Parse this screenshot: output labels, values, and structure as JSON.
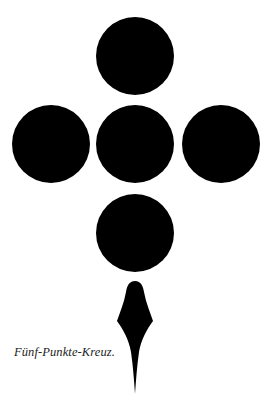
{
  "figure": {
    "caption": "Fünf-Punkte-Kreuz.",
    "fill_color": "#000000",
    "background_color": "#ffffff",
    "dots": [
      {
        "name": "top",
        "cx": 135,
        "cy": 56,
        "r": 39
      },
      {
        "name": "left",
        "cx": 51,
        "cy": 144,
        "r": 39
      },
      {
        "name": "center",
        "cx": 135,
        "cy": 144,
        "r": 39
      },
      {
        "name": "right",
        "cx": 221,
        "cy": 144,
        "r": 39
      },
      {
        "name": "bottom",
        "cx": 135,
        "cy": 233,
        "r": 39
      }
    ],
    "spike": {
      "top_y": 281,
      "widest_y": 321,
      "tip_y": 394,
      "cx": 135
    }
  }
}
